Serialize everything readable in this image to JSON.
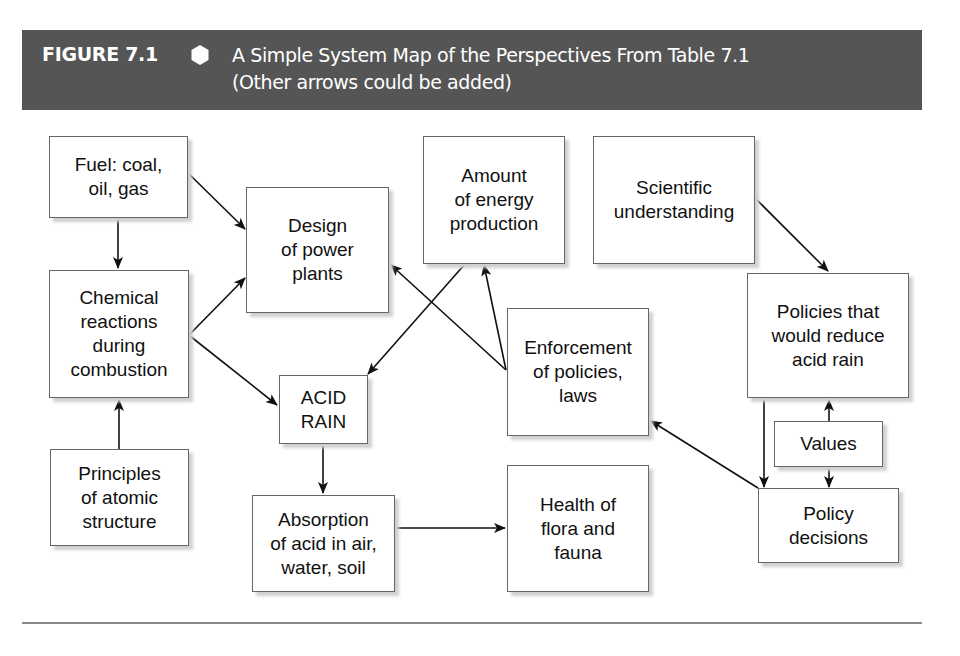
{
  "header": {
    "figure_number": "FIGURE 7.1",
    "icon": "hexagon-icon",
    "title_line1": "A Simple System Map of the Perspectives From Table 7.1",
    "title_line2": "(Other arrows could be added)",
    "background_color": "#555555",
    "text_color": "#ffffff"
  },
  "nodes": {
    "fuel": {
      "label": "Fuel: coal,\noil, gas"
    },
    "design": {
      "label": "Design\nof power\nplants"
    },
    "amount": {
      "label": "Amount\nof energy\nproduction"
    },
    "scientific": {
      "label": "Scientific\nunderstanding"
    },
    "chemical": {
      "label": "Chemical\nreactions\nduring\ncombustion"
    },
    "policies_reduce": {
      "label": "Policies that\nwould reduce\nacid rain"
    },
    "acid_rain": {
      "label": "ACID\nRAIN"
    },
    "enforcement": {
      "label": "Enforcement\nof policies,\nlaws"
    },
    "values": {
      "label": "Values"
    },
    "policy_decisions": {
      "label": "Policy\ndecisions"
    },
    "principles": {
      "label": "Principles\nof atomic\nstructure"
    },
    "absorption": {
      "label": "Absorption\nof acid in air,\nwater, soil"
    },
    "health": {
      "label": "Health of\nflora and\nfauna"
    }
  },
  "edges": [
    {
      "from": "fuel",
      "to": "design"
    },
    {
      "from": "fuel",
      "to": "chemical"
    },
    {
      "from": "chemical",
      "to": "design",
      "bidirectional": true
    },
    {
      "from": "chemical",
      "to": "acid_rain"
    },
    {
      "from": "principles",
      "to": "chemical"
    },
    {
      "from": "amount",
      "to": "acid_rain"
    },
    {
      "from": "enforcement",
      "to": "design"
    },
    {
      "from": "enforcement",
      "to": "amount"
    },
    {
      "from": "acid_rain",
      "to": "absorption"
    },
    {
      "from": "absorption",
      "to": "health"
    },
    {
      "from": "scientific",
      "to": "policies_reduce"
    },
    {
      "from": "policies_reduce",
      "to": "policy_decisions"
    },
    {
      "from": "values",
      "to": "policies_reduce"
    },
    {
      "from": "values",
      "to": "policy_decisions"
    },
    {
      "from": "policy_decisions",
      "to": "enforcement"
    }
  ]
}
